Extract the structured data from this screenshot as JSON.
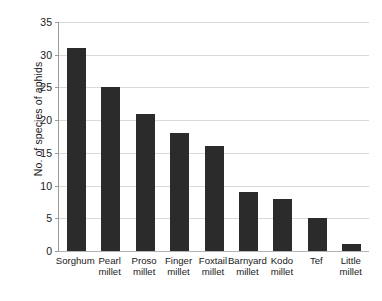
{
  "chart_data": {
    "type": "bar",
    "title": "",
    "subtitle": "",
    "xlabel": "",
    "ylabel": "No. of species of aphids",
    "categories": [
      "Sorghum",
      "Pearl millet",
      "Proso millet",
      "Finger millet",
      "Foxtail millet",
      "Barnyard millet",
      "Kodo millet",
      "Tef",
      "Little millet"
    ],
    "category_lines": [
      [
        "Sorghum"
      ],
      [
        "Pearl",
        "millet"
      ],
      [
        "Proso",
        "millet"
      ],
      [
        "Finger",
        "millet"
      ],
      [
        "Foxtail",
        "millet"
      ],
      [
        "Barnyard",
        "millet"
      ],
      [
        "Kodo",
        "millet"
      ],
      [
        "Tef"
      ],
      [
        "Little",
        "millet"
      ]
    ],
    "values": [
      31,
      25,
      21,
      18,
      16,
      9,
      8,
      5,
      1
    ],
    "ylim": [
      0,
      35
    ],
    "ytick_values": [
      0,
      5,
      10,
      15,
      20,
      25,
      30,
      35
    ],
    "ytick_labels": [
      "0",
      "5",
      "10",
      "15",
      "20",
      "25",
      "30",
      "35"
    ],
    "grid": "horizontal",
    "legend": "none",
    "bar_color": "#2b2b2b",
    "gridline_color": "#d9d9d9",
    "axis_color": "#9a9a9a",
    "background_color": "#ffffff"
  }
}
